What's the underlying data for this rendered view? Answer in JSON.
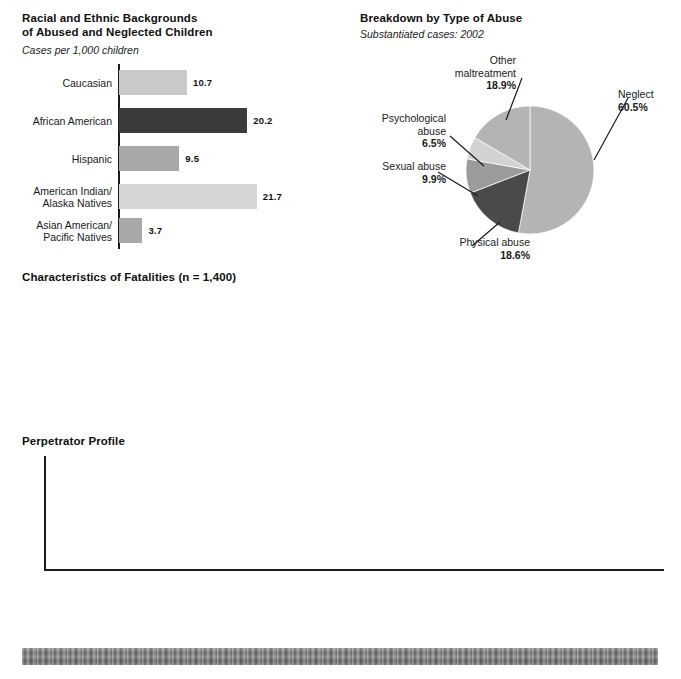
{
  "palette": {
    "bar_light": "#c9c9c9",
    "bar_lighter": "#d6d6d6",
    "bar_mid": "#a8a8a8",
    "bar_dark": "#3b3b3b",
    "bar_gray": "#8c8c8c",
    "bar_shadow": "#d9d9d9",
    "pie_light": "#b4b4b4",
    "pie_lighter": "#d2d2d2",
    "pie_mid": "#9b9b9b",
    "pie_dark": "#4a4a4a",
    "axis": "#1b1b1b",
    "text": "#1a1a1a"
  },
  "racial_chart": {
    "title": "Racial and Ethnic Backgrounds\nof Abused and Neglected Children",
    "subtitle": "Cases per 1,000 children"
  },
  "abuse_pie": {
    "title": "Breakdown by Type of Abuse",
    "subtitle": "Substantiated cases: 2002"
  },
  "fatalities": {
    "title": "Characteristics of Fatalities (n = 1,400)"
  },
  "perpetrator": {
    "title": "Perpetrator Profile"
  },
  "chart_data": [
    {
      "id": "racial-backgrounds",
      "type": "bar",
      "orientation": "horizontal",
      "title": "Racial and Ethnic Backgrounds of Abused and Neglected Children",
      "subtitle": "Cases per 1,000 children",
      "xlabel": "",
      "ylabel": "",
      "xlim": [
        0,
        24
      ],
      "grid": false,
      "legend": "none",
      "categories": [
        "Caucasian",
        "African American",
        "Hispanic",
        "American Indian/\nAlaska Natives",
        "Asian American/\nPacific Natives"
      ],
      "values": [
        10.7,
        20.2,
        9.5,
        21.7,
        3.7
      ],
      "value_labels": [
        "10.7",
        "20.2",
        "9.5",
        "21.7",
        "3.7"
      ],
      "colors": [
        "#c9c9c9",
        "#3b3b3b",
        "#a8a8a8",
        "#d6d6d6",
        "#a8a8a8"
      ]
    },
    {
      "id": "abuse-breakdown",
      "type": "pie",
      "title": "Breakdown by Type of Abuse",
      "subtitle": "Substantiated cases: 2002",
      "legend": "callouts",
      "labels": [
        "Neglect",
        "Physical abuse",
        "Sexual abuse",
        "Psychological\nabuse",
        "Other\nmaltreatment"
      ],
      "values": [
        60.5,
        18.6,
        9.9,
        6.5,
        18.9
      ],
      "value_labels": [
        "60.5%",
        "18.6%",
        "9.9%",
        "6.5%",
        "18.9%"
      ],
      "colors": [
        "#b4b4b4",
        "#4a4a4a",
        "#9b9b9b",
        "#d2d2d2",
        "#b4b4b4"
      ]
    },
    {
      "id": "fatalities-characteristics",
      "type": "pie",
      "title": "Characteristics of Fatalities (n = 1,400)",
      "note": "seven small single-value pies; highlighted share shown in dark",
      "categories": [
        "Prior contact\nwith child\nprotective\nservices",
        "Deaths\ndue to\nneglect",
        "Deaths\ndue to\nabuse",
        "Multiple\nmaltreatment",
        "Deaths\nto children\nunder 5",
        "Deaths\nto children\nunder 1",
        "Perpetrator\nwas 1 or both\nparents"
      ],
      "values": [
        12.0,
        37.6,
        29.9,
        28.9,
        76.1,
        41.2,
        78.9
      ],
      "value_labels": [
        "12.0%",
        "37.6%",
        "29.9%",
        "28.9%",
        "76.1%",
        "41.2%",
        "78.9%"
      ],
      "colors": [
        "#4a4a4a",
        "#cfcfcf"
      ]
    },
    {
      "id": "perpetrator-profile",
      "type": "bar",
      "orientation": "vertical",
      "title": "Perpetrator Profile",
      "xlabel": "",
      "ylabel": "",
      "ylim": [
        0,
        90
      ],
      "yticks": [
        90,
        80,
        70,
        60,
        50,
        40,
        30,
        20,
        10
      ],
      "grid": false,
      "legend": "none",
      "groups": [
        {
          "name": "maltreatment-type",
          "categories": [
            "Neglected Child",
            "Physically\nAbused Child",
            "Sexually\nAbused Child"
          ],
          "values": [
            53.3,
            11.0,
            6.9
          ],
          "value_labels": [
            "53.3%",
            "11.0%",
            "6.9%"
          ]
        },
        {
          "name": "gender",
          "categories": [
            "Female",
            "Male"
          ],
          "values": [
            58.3,
            41.7
          ],
          "value_labels": [
            "58.3%",
            "41.7%"
          ]
        },
        {
          "name": "relationship",
          "categories": [
            "Parents",
            "Other Relatives",
            "Unmarried\nPartner of Parents"
          ],
          "values": [
            81.7,
            6.6,
            2.9
          ],
          "value_labels": [
            "81.7%",
            "6.6%",
            "2.9%"
          ]
        },
        {
          "name": "age",
          "categories": [
            "Age 19 or Younger",
            "Age 20–29",
            "Age 30–39",
            "Age 40–49",
            "Age 50 or Older"
          ],
          "values": [
            5.2,
            33.1,
            39.6,
            16.8,
            5.2
          ],
          "value_labels": [
            "5.2%",
            "33.1%",
            "39.6%",
            "16.8%",
            "5.2%"
          ]
        }
      ]
    }
  ]
}
